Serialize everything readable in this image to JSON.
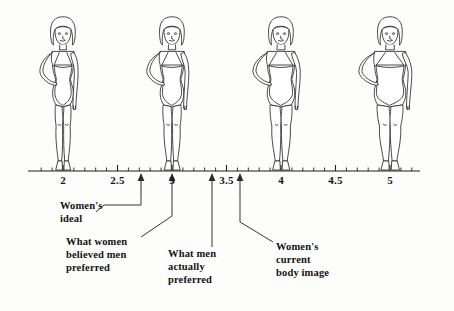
{
  "figure": {
    "type": "annotated-scale-illustration",
    "title_visible": false,
    "background_color": "#fdfdfb",
    "ink_color": "#1f1f1f"
  },
  "axis": {
    "name": "body-size-scale",
    "min": 1.75,
    "max": 5.35,
    "y_px": 171,
    "left_px": 28,
    "right_px": 420,
    "px_per_unit": 109,
    "origin_value": 2,
    "origin_px": 63,
    "major_ticks": [
      {
        "value": 2,
        "label": "2"
      },
      {
        "value": 2.5,
        "label": "2.5"
      },
      {
        "value": 3,
        "label": "3"
      },
      {
        "value": 3.5,
        "label": "3.5"
      },
      {
        "value": 4,
        "label": "4"
      },
      {
        "value": 4.5,
        "label": "4.5"
      },
      {
        "value": 5,
        "label": "5"
      }
    ],
    "minor_tick_step": 0.1
  },
  "figures": [
    {
      "name": "silhouette-slimmest",
      "value": 2.12,
      "x_px": 63,
      "build": "very-slim"
    },
    {
      "name": "silhouette-slim",
      "value": 3.0,
      "x_px": 172,
      "build": "slim"
    },
    {
      "name": "silhouette-medium",
      "value": 3.95,
      "x_px": 281,
      "build": "medium"
    },
    {
      "name": "silhouette-fuller",
      "value": 4.95,
      "x_px": 390,
      "build": "fuller"
    }
  ],
  "chart_data": {
    "type": "scatter",
    "title": "",
    "xlabel": "",
    "ylabel": "",
    "xlim": [
      1.75,
      5.35
    ],
    "grid": false,
    "legend": "none",
    "categories": [
      "Women's ideal",
      "What women believed men preferred",
      "What men actually preferred",
      "Women's current body image"
    ],
    "values": [
      2.68,
      2.95,
      3.32,
      3.58
    ],
    "tick_labels": [
      "2",
      "2.5",
      "3",
      "3.5",
      "4",
      "4.5",
      "5"
    ],
    "annotations": [
      {
        "label": "Women's ideal",
        "value": 2.68
      },
      {
        "label": "What women believed men preferred",
        "value": 2.95
      },
      {
        "label": "What men actually preferred",
        "value": 3.32
      },
      {
        "label": "Women's current body image",
        "value": 3.58
      }
    ]
  },
  "markers": [
    {
      "id": "womens-ideal",
      "label": "Women's\nideal",
      "value": 2.68,
      "arrow_x_px": 141,
      "arrow_top_px": 175,
      "arrow_bottom_px": 196,
      "label_x_px": 60,
      "label_y_px": 199,
      "leader": "M141,196 L141,205 L104,205 L96,212"
    },
    {
      "id": "what-women-believed-men-preferred",
      "label": "What women\nbelieved men\npreferred",
      "value": 2.95,
      "arrow_x_px": 172,
      "arrow_top_px": 175,
      "arrow_bottom_px": 196,
      "label_x_px": 66,
      "label_y_px": 235,
      "leader": "M172,196 L172,216 L141,237"
    },
    {
      "id": "what-men-actually-preferred",
      "label": "What men\nactually\npreferred",
      "value": 3.32,
      "arrow_x_px": 212,
      "arrow_top_px": 175,
      "arrow_bottom_px": 196,
      "label_x_px": 168,
      "label_y_px": 247,
      "leader": "M212,196 L212,247"
    },
    {
      "id": "womens-current-body-image",
      "label": "Women's\ncurrent\nbody image",
      "value": 3.58,
      "arrow_x_px": 240,
      "arrow_top_px": 175,
      "arrow_bottom_px": 196,
      "label_x_px": 276,
      "label_y_px": 240,
      "leader": "M240,196 L240,222 L273,242"
    }
  ]
}
